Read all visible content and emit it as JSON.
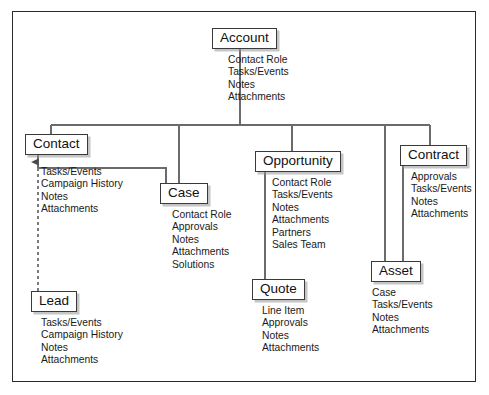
{
  "diagram": {
    "type": "entity-tree",
    "background_color": "#ffffff",
    "border_color": "#2b2b2b",
    "line_color": "#6b6b6b",
    "box_border_color": "#3a3a3a",
    "text_color": "#111111"
  },
  "nodes": [
    {
      "id": "account",
      "label": "Account",
      "box": {
        "x": 212,
        "y": 28,
        "w": 56
      },
      "items_pos": {
        "x": 228,
        "y": 54
      },
      "items": [
        "Contact Role",
        "Tasks/Events",
        "Notes",
        "Attachments"
      ]
    },
    {
      "id": "contact",
      "label": "Contact",
      "box": {
        "x": 25,
        "y": 134,
        "w": 55
      },
      "items_pos": {
        "x": 41,
        "y": 166
      },
      "items": [
        "Tasks/Events",
        "Campaign History",
        "Notes",
        "Attachments"
      ]
    },
    {
      "id": "case",
      "label": "Case",
      "box": {
        "x": 160,
        "y": 183,
        "w": 38
      },
      "items_pos": {
        "x": 172,
        "y": 209
      },
      "items": [
        "Contact Role",
        "Approvals",
        "Notes",
        "Attachments",
        "Solutions"
      ]
    },
    {
      "id": "opportunity",
      "label": "Opportunity",
      "box": {
        "x": 255,
        "y": 151,
        "w": 74
      },
      "items_pos": {
        "x": 272,
        "y": 177
      },
      "items": [
        "Contact Role",
        "Tasks/Events",
        "Notes",
        "Attachments",
        "Partners",
        "Sales Team"
      ]
    },
    {
      "id": "contract",
      "label": "Contract",
      "box": {
        "x": 400,
        "y": 145,
        "w": 60
      },
      "items_pos": {
        "x": 411,
        "y": 171
      },
      "items": [
        "Approvals",
        "Tasks/Events",
        "Notes",
        "Attachments"
      ]
    },
    {
      "id": "quote",
      "label": "Quote",
      "box": {
        "x": 252,
        "y": 279,
        "w": 43
      },
      "items_pos": {
        "x": 262,
        "y": 305
      },
      "items": [
        "Line Item",
        "Approvals",
        "Notes",
        "Attachments"
      ]
    },
    {
      "id": "asset",
      "label": "Asset",
      "box": {
        "x": 371,
        "y": 261,
        "w": 40
      },
      "items_pos": {
        "x": 372,
        "y": 287
      },
      "items": [
        "Case",
        "Tasks/Events",
        "Notes",
        "Attachments"
      ]
    },
    {
      "id": "lead",
      "label": "Lead",
      "box": {
        "x": 31,
        "y": 291,
        "w": 37
      },
      "items_pos": {
        "x": 41,
        "y": 317
      },
      "items": [
        "Tasks/Events",
        "Campaign History",
        "Notes",
        "Attachments"
      ]
    }
  ],
  "connections": [
    {
      "from": "account",
      "to": "bus",
      "style": "solid"
    },
    {
      "from": "bus",
      "to": "contact",
      "style": "solid"
    },
    {
      "from": "bus",
      "to": "case",
      "style": "solid"
    },
    {
      "from": "bus",
      "to": "opportunity",
      "style": "solid"
    },
    {
      "from": "bus",
      "to": "contract",
      "style": "solid"
    },
    {
      "from": "bus",
      "to": "asset",
      "style": "solid"
    },
    {
      "from": "contact",
      "to": "case",
      "style": "solid"
    },
    {
      "from": "opportunity",
      "to": "quote",
      "style": "solid"
    },
    {
      "from": "contract",
      "to": "asset",
      "style": "solid"
    },
    {
      "from": "lead",
      "to": "contact",
      "style": "dashed",
      "arrow": "up"
    }
  ]
}
